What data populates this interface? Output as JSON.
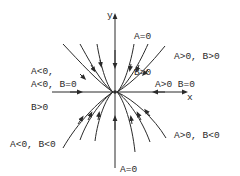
{
  "diagram": {
    "type": "phase-portrait",
    "axes": {
      "x_label": "x",
      "y_label": "y"
    },
    "colors": {
      "stroke": "#2a2a2a",
      "background": "#ffffff"
    },
    "regions": [
      {
        "id": "a-zero-b-pos",
        "line1": "A=0",
        "line2": "B>0"
      },
      {
        "id": "a-neg-b-pos",
        "line1": "A<0,",
        "line2": "B>0"
      },
      {
        "id": "a-pos-b-pos",
        "line1": "A>0, B>0"
      },
      {
        "id": "a-neg-b-zero",
        "line1": "A<0, B=0"
      },
      {
        "id": "a-pos-b-zero",
        "line1": "A>0 B=0"
      },
      {
        "id": "a-neg-b-neg",
        "line1": "A<0, B<0"
      },
      {
        "id": "a-pos-b-neg",
        "line1": "A>0, B<0"
      },
      {
        "id": "a-zero-b-neg",
        "line1": "A=0",
        "line2": "B<0"
      }
    ]
  }
}
